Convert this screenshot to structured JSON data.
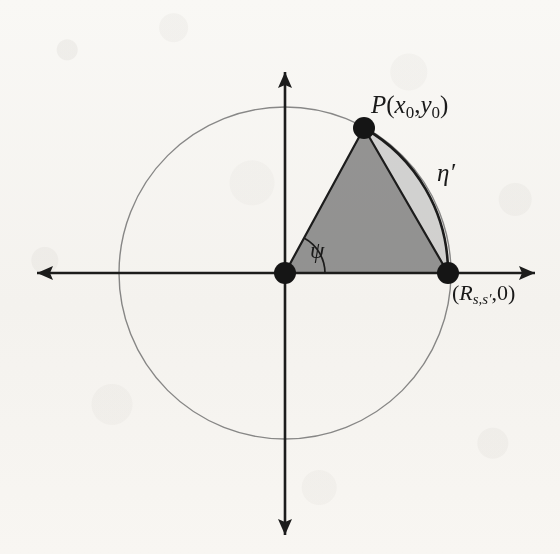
{
  "figure": {
    "type": "geometric-diagram",
    "background_color": "#fbfaf8",
    "canvas": {
      "width": 560,
      "height": 554
    }
  },
  "axes": {
    "x_axis": {
      "name": "horizontal-axis",
      "from_x": 37,
      "to_x": 535,
      "y": 273,
      "double_headed": true,
      "color": "#1c1c1c"
    },
    "y_axis": {
      "name": "vertical-axis",
      "x": 285,
      "from_y": 72,
      "to_y": 535,
      "double_headed": true,
      "color": "#1c1c1c"
    }
  },
  "circle": {
    "center_x": 285,
    "center_y": 273,
    "radius": 166,
    "stroke_color": "#8a8a8a",
    "stroke_width": 1.4,
    "fill": "none"
  },
  "points": [
    {
      "id": "origin",
      "label": "",
      "x": 285,
      "y": 273,
      "radius": 11,
      "color": "#151515"
    },
    {
      "id": "point-p",
      "label": "P(x₀,y₀)",
      "x": 364,
      "y": 128,
      "radius": 11,
      "color": "#151515"
    },
    {
      "id": "radius-point",
      "label": "(Rₛ,ₛ′,0)",
      "x": 448,
      "y": 273,
      "radius": 11,
      "color": "#151515"
    }
  ],
  "triangle": {
    "name": "shaded-triangle",
    "vertices": "285,273 364,128 448,273",
    "fill_color": "#969696",
    "stroke_color": "#1c1c1c",
    "stroke_width": 2.2
  },
  "segment": {
    "name": "circular-segment",
    "fill_color": "#d6d6d6",
    "stroke_color": "#1c1c1c",
    "stroke_width": 2.2,
    "chord_from": "364,128",
    "chord_to": "448,273",
    "arc_radius": 166
  },
  "angle": {
    "name": "psi-angle",
    "symbol": "ψ",
    "value_degrees": 61.4,
    "vertex_x": 285,
    "vertex_y": 273,
    "arc_radius": 40,
    "stroke_color": "#1c1c1c"
  },
  "labels": {
    "point_p": {
      "main": "P",
      "open_paren": "(",
      "x_var": "x",
      "x_sub": "0",
      "comma": ",",
      "y_var": "y",
      "y_sub": "0",
      "close_paren": ")",
      "full": "P(x₀,y₀)"
    },
    "radius_point": {
      "open_paren": "(",
      "r_var": "R",
      "r_sub": "s,s′",
      "comma": ",",
      "zero": "0",
      "close_paren": ")",
      "full": "(Rₛ,ₛ′,0)"
    },
    "eta": {
      "symbol": "η",
      "prime": "′",
      "full": "η′"
    },
    "psi": {
      "symbol": "ψ",
      "full": "ψ"
    }
  },
  "colors": {
    "ink": "#1c1c1c",
    "triangle_fill": "#969696",
    "segment_fill": "#d6d6d6",
    "circle_stroke": "#8a8a8a",
    "paper": "#fbfaf8"
  }
}
